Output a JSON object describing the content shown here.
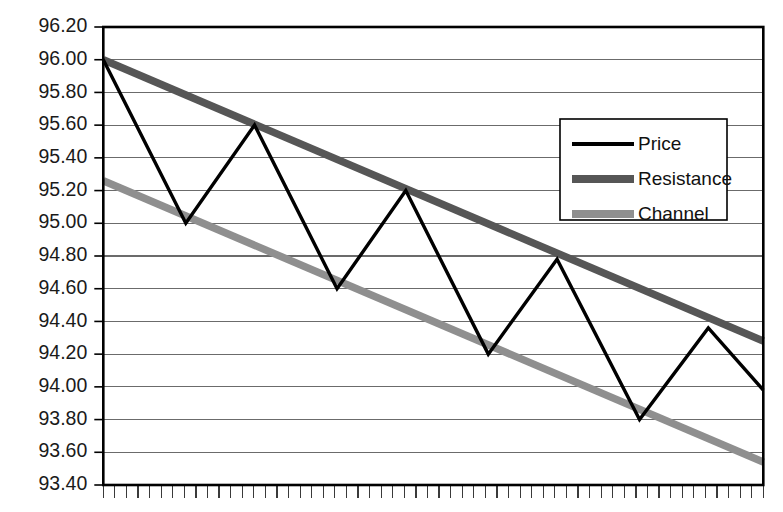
{
  "chart_data": {
    "type": "line",
    "title": "",
    "subtitle": "",
    "xlabel": "",
    "ylabel": "",
    "ylim": [
      93.4,
      96.2
    ],
    "ytick_step": 0.2,
    "ytick_labels": [
      "96.20",
      "96.00",
      "95.80",
      "95.60",
      "95.40",
      "95.20",
      "95.00",
      "94.80",
      "94.60",
      "94.40",
      "94.20",
      "94.00",
      "93.80",
      "93.60",
      "93.40"
    ],
    "ytick_values": [
      96.2,
      96.0,
      95.8,
      95.6,
      95.4,
      95.2,
      95.0,
      94.8,
      94.6,
      94.4,
      94.2,
      94.0,
      93.8,
      93.6,
      93.4
    ],
    "grid": true,
    "grid_axis": "y",
    "xtick_labels": [],
    "xtick_count": 57,
    "x_axis_labeled": false,
    "legend_position": "upper-right",
    "legend_entries": [
      "Price",
      "Resistance",
      "Channel"
    ],
    "series": [
      {
        "name": "Price",
        "color": "#000000",
        "width": 3.4,
        "x": [
          0,
          6,
          11,
          17,
          22,
          28,
          33,
          39,
          44,
          48
        ],
        "values": [
          96.0,
          95.0,
          95.6,
          94.6,
          95.2,
          94.2,
          94.78,
          93.8,
          94.36,
          93.98
        ]
      },
      {
        "name": "Resistance",
        "color": "#565656",
        "width": 7.5,
        "x": [
          0,
          48
        ],
        "values": [
          96.0,
          94.28
        ]
      },
      {
        "name": "Channel",
        "color": "#8f8f8f",
        "width": 7.5,
        "x": [
          0,
          48
        ],
        "values": [
          95.26,
          93.54
        ]
      }
    ],
    "annotations": []
  },
  "axes": {
    "y_axis_name": "price-axis",
    "x_axis_name": "time-axis"
  },
  "legend": {
    "items": [
      {
        "label": "Price",
        "color": "#000000",
        "swatch_width": 4
      },
      {
        "label": "Resistance",
        "color": "#565656",
        "swatch_width": 8
      },
      {
        "label": "Channel",
        "color": "#8f8f8f",
        "swatch_width": 8
      }
    ]
  },
  "colors": {
    "price": "#000000",
    "resistance": "#565656",
    "channel": "#8f8f8f",
    "grid": "#6b6b6b",
    "border": "#000000",
    "background": "#ffffff",
    "text": "#1a1a1a"
  }
}
